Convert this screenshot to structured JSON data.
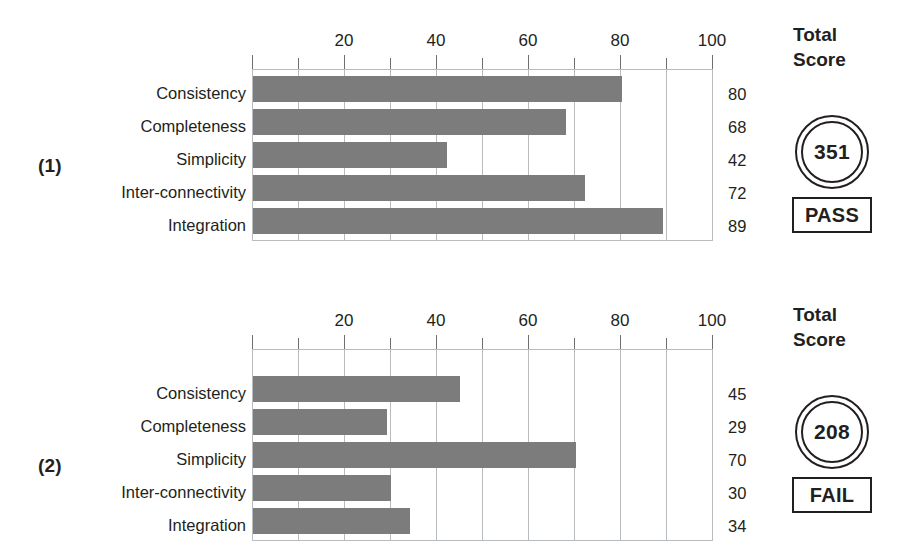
{
  "chart_data": [
    {
      "type": "bar",
      "orientation": "horizontal",
      "title": "(1)",
      "categories": [
        "Consistency",
        "Completeness",
        "Simplicity",
        "Inter-connectivity",
        "Integration"
      ],
      "values": [
        80,
        68,
        42,
        72,
        89
      ],
      "value_labels": [
        "80",
        "68",
        "42",
        "72",
        "89"
      ],
      "xlabel": "",
      "ylabel": "",
      "xlim": [
        0,
        100
      ],
      "xticks": [
        0,
        10,
        20,
        30,
        40,
        50,
        60,
        70,
        80,
        90,
        100
      ],
      "xtick_labels": [
        "",
        "",
        "20",
        "",
        "40",
        "",
        "60",
        "",
        "80",
        "",
        "100"
      ],
      "grid": true,
      "legend": false,
      "bar_color": "#7c7c7c",
      "total_score_title_line1": "Total",
      "total_score_title_line2": "Score",
      "total_score": "351",
      "verdict": "PASS"
    },
    {
      "type": "bar",
      "orientation": "horizontal",
      "title": "(2)",
      "categories": [
        "Consistency",
        "Completeness",
        "Simplicity",
        "Inter-connectivity",
        "Integration"
      ],
      "values": [
        45,
        29,
        70,
        30,
        34
      ],
      "value_labels": [
        "45",
        "29",
        "70",
        "30",
        "34"
      ],
      "xlabel": "",
      "ylabel": "",
      "xlim": [
        0,
        100
      ],
      "xticks": [
        0,
        10,
        20,
        30,
        40,
        50,
        60,
        70,
        80,
        90,
        100
      ],
      "xtick_labels": [
        "",
        "",
        "20",
        "",
        "40",
        "",
        "60",
        "",
        "80",
        "",
        "100"
      ],
      "grid": true,
      "legend": false,
      "bar_color": "#7c7c7c",
      "total_score_title_line1": "Total",
      "total_score_title_line2": "Score",
      "total_score": "208",
      "verdict": "FAIL"
    }
  ]
}
